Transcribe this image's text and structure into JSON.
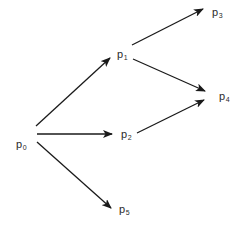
{
  "diagram": {
    "type": "directed-graph",
    "background": "#ffffff",
    "edge_color": "#1a1a1a",
    "label_color": "#2a2a2a",
    "nodes": [
      {
        "id": "p0",
        "base": "p",
        "sub": "0",
        "x": 16,
        "y": 139
      },
      {
        "id": "p1",
        "base": "p",
        "sub": "1",
        "x": 117,
        "y": 49
      },
      {
        "id": "p2",
        "base": "p",
        "sub": "2",
        "x": 121,
        "y": 129
      },
      {
        "id": "p3",
        "base": "p",
        "sub": "3",
        "x": 212,
        "y": 7
      },
      {
        "id": "p4",
        "base": "p",
        "sub": "4",
        "x": 219,
        "y": 91
      },
      {
        "id": "p5",
        "base": "p",
        "sub": "5",
        "x": 119,
        "y": 204
      }
    ],
    "edges": [
      {
        "from": "p0",
        "to": "p1",
        "x1": 36,
        "y1": 126,
        "x2": 110,
        "y2": 58
      },
      {
        "from": "p0",
        "to": "p2",
        "x1": 37,
        "y1": 134,
        "x2": 112,
        "y2": 134
      },
      {
        "from": "p0",
        "to": "p5",
        "x1": 37,
        "y1": 142,
        "x2": 111,
        "y2": 208
      },
      {
        "from": "p1",
        "to": "p3",
        "x1": 132,
        "y1": 45,
        "x2": 203,
        "y2": 9
      },
      {
        "from": "p1",
        "to": "p4",
        "x1": 133,
        "y1": 59,
        "x2": 205,
        "y2": 91
      },
      {
        "from": "p2",
        "to": "p4",
        "x1": 137,
        "y1": 133,
        "x2": 204,
        "y2": 100
      }
    ]
  }
}
